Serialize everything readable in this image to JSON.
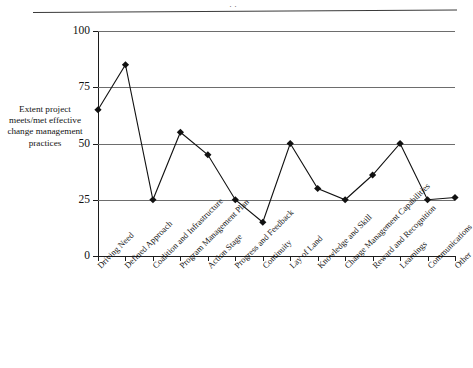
{
  "title_partial": "· ·",
  "y_axis_title": "Extent project meets/met effective change management practices",
  "chart_data": {
    "type": "line",
    "title": "",
    "subtitle": "",
    "xlabel": "",
    "ylabel": "Extent project meets/met effective change management practices",
    "ylim": [
      0,
      100
    ],
    "yticks": [
      0,
      25,
      50,
      75,
      100
    ],
    "ytick_labels": [
      "0",
      "25",
      "50",
      "75",
      "100"
    ],
    "grid": "horizontal",
    "legend": "none",
    "marker": "diamond",
    "line_color": "#111111",
    "marker_color": "#111111",
    "grid_color": "#6d6d6d",
    "categories": [
      "Driving Need",
      "Defined Approach",
      "Coalition and Infrastructure",
      "Program Management Plan",
      "Action Stage",
      "Progress and Feedback",
      "Continuity",
      "Lay of Land",
      "Knowledge and Skill",
      "Change Management Capabilities",
      "Reward and Recognition",
      "Learnings",
      "Communications",
      "Other"
    ],
    "values": [
      65,
      85,
      25,
      55,
      45,
      25,
      15,
      50,
      30,
      25,
      36,
      50,
      25,
      26
    ],
    "series": [
      {
        "name": "Extent project meets/met effective change management practices",
        "values": [
          65,
          85,
          25,
          55,
          45,
          25,
          15,
          50,
          30,
          25,
          36,
          50,
          25,
          26
        ]
      }
    ]
  }
}
